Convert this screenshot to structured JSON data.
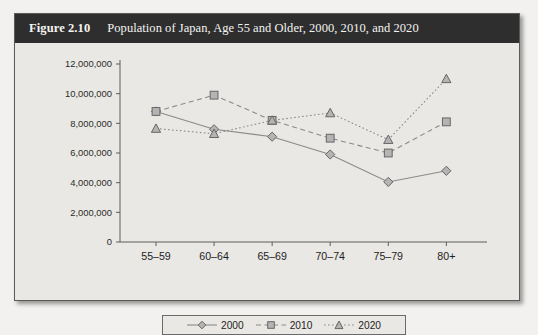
{
  "figure": {
    "number_label": "Figure 2.10",
    "title": "Population of Japan, Age 55 and Older, 2000, 2010, and 2020"
  },
  "legend": {
    "position": "bottom-center",
    "entries": [
      {
        "label": "2000",
        "marker": "diamond-marker",
        "line": "solid"
      },
      {
        "label": "2010",
        "marker": "square-marker",
        "line": "dashed"
      },
      {
        "label": "2020",
        "marker": "triangle-marker",
        "line": "dotted"
      }
    ]
  },
  "axis": {
    "y_ticks": [
      "12,000,000",
      "10,000,000",
      "8,000,000",
      "6,000,000",
      "4,000,000",
      "2,000,000",
      "0"
    ],
    "x_ticks": [
      "55–59",
      "60–64",
      "65–69",
      "70–74",
      "75–79",
      "80+"
    ]
  },
  "colors": {
    "title_bar": "#2e2e2e",
    "title_text": "#f4f4f2",
    "panel": "#e9e8e4",
    "page": "#f2f1ef",
    "axis": "#5c5c5c",
    "series": "#8a8a8a",
    "marker_fill": "#b4b4b4",
    "marker_stroke": "#666666"
  },
  "chart_data": {
    "type": "line",
    "title": "Population of Japan, Age 55 and Older, 2000, 2010, and 2020",
    "xlabel": "",
    "ylabel": "",
    "categories": [
      "55–59",
      "60–64",
      "65–69",
      "70–74",
      "75–79",
      "80+"
    ],
    "ylim": [
      0,
      12000000
    ],
    "ytick_values": [
      0,
      2000000,
      4000000,
      6000000,
      8000000,
      10000000,
      12000000
    ],
    "grid": false,
    "legend": [
      "2000",
      "2010",
      "2020"
    ],
    "series": [
      {
        "name": "2000",
        "marker": "diamond",
        "linestyle": "solid",
        "values": [
          8800000,
          7600000,
          7100000,
          5900000,
          4050000,
          4800000
        ]
      },
      {
        "name": "2010",
        "marker": "square",
        "linestyle": "dashed",
        "values": [
          8800000,
          9900000,
          8200000,
          7000000,
          6000000,
          8100000
        ]
      },
      {
        "name": "2020",
        "marker": "triangle",
        "linestyle": "dotted",
        "values": [
          7650000,
          7300000,
          8200000,
          8700000,
          6900000,
          11000000
        ]
      }
    ]
  }
}
